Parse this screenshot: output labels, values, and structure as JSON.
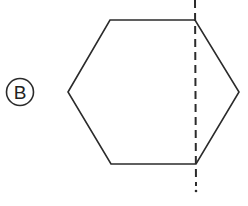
{
  "figure": {
    "option_label": "B",
    "shape": "hexagon",
    "line_color": "#2b2b2b",
    "hexagon_points": [
      [
        68,
        92
      ],
      [
        110,
        20
      ],
      [
        195,
        20
      ],
      [
        239,
        92
      ],
      [
        196,
        164
      ],
      [
        111,
        164
      ]
    ],
    "fold_line": {
      "style": "dashed",
      "x": 195,
      "y_start": 0,
      "y_end": 192
    }
  }
}
